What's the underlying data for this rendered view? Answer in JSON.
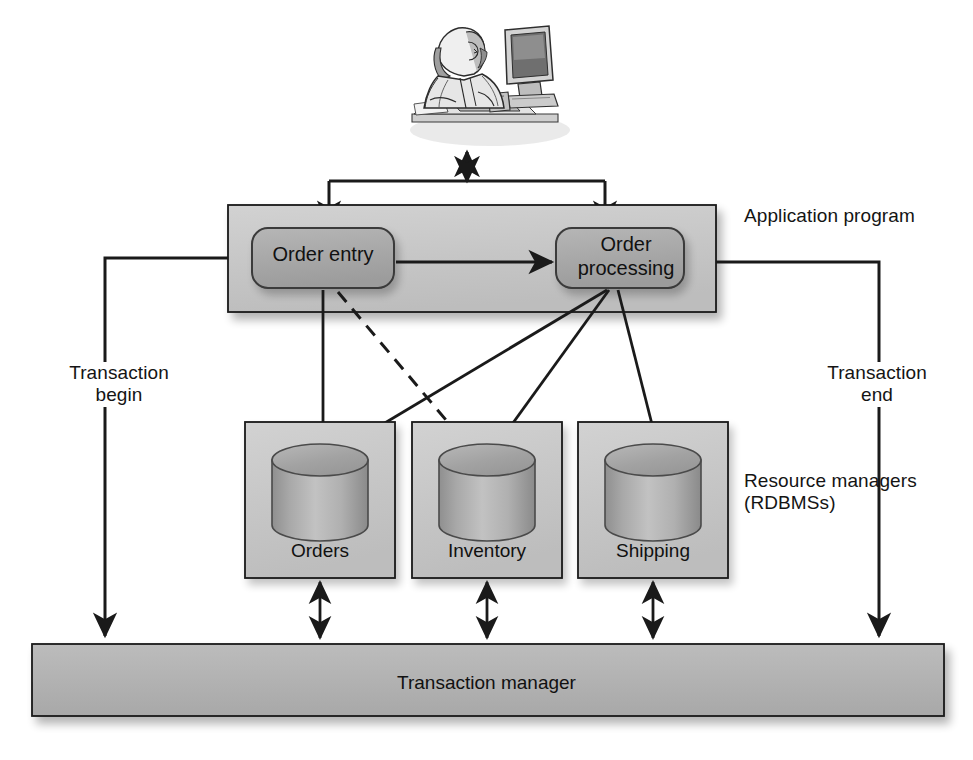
{
  "diagram": {
    "actor": {
      "name": "user-at-computer",
      "alt": "Person seated at a desktop computer"
    },
    "application_program": {
      "label": "Application program",
      "fill": "#c9c9c9",
      "stroke": "#1a1a1a",
      "components": [
        {
          "id": "order-entry",
          "label": "Order entry",
          "fill": "#a9a9a9"
        },
        {
          "id": "order-processing",
          "label": "Order processing",
          "fill": "#a9a9a9"
        }
      ]
    },
    "resource_managers": {
      "label": "Resource managers\n(RDBMSs)",
      "fill": "#c9c9c9",
      "stroke": "#1a1a1a",
      "databases": [
        {
          "id": "orders",
          "label": "Orders"
        },
        {
          "id": "inventory",
          "label": "Inventory"
        },
        {
          "id": "shipping",
          "label": "Shipping"
        }
      ]
    },
    "transaction_manager": {
      "label": "Transaction manager",
      "fill": "#b0b0b0",
      "stroke": "#1a1a1a"
    },
    "edge_labels": {
      "transaction_begin": "Transaction\nbegin",
      "transaction_end": "Transaction\nend"
    },
    "connections": [
      {
        "from": "user-at-computer",
        "to": "application-bus",
        "style": "solid",
        "arrow": "both"
      },
      {
        "from": "application-bus",
        "to": "order-entry",
        "style": "solid",
        "arrow": "end"
      },
      {
        "from": "order-processing",
        "to": "application-bus",
        "style": "solid",
        "arrow": "end"
      },
      {
        "from": "order-entry",
        "to": "order-processing",
        "style": "solid",
        "arrow": "end"
      },
      {
        "from": "order-entry",
        "to": "orders",
        "style": "solid",
        "arrow": "end"
      },
      {
        "from": "order-entry",
        "to": "inventory",
        "style": "dashed",
        "arrow": "end"
      },
      {
        "from": "order-processing",
        "to": "orders",
        "style": "solid",
        "arrow": "end"
      },
      {
        "from": "order-processing",
        "to": "inventory",
        "style": "solid",
        "arrow": "end"
      },
      {
        "from": "order-processing",
        "to": "shipping",
        "style": "solid",
        "arrow": "end"
      },
      {
        "from": "application-program",
        "to": "transaction-manager",
        "style": "solid",
        "arrow": "end",
        "label": "Transaction begin",
        "side": "left"
      },
      {
        "from": "application-program",
        "to": "transaction-manager",
        "style": "solid",
        "arrow": "end",
        "label": "Transaction end",
        "side": "right"
      },
      {
        "from": "orders",
        "to": "transaction-manager",
        "style": "solid",
        "arrow": "both"
      },
      {
        "from": "inventory",
        "to": "transaction-manager",
        "style": "solid",
        "arrow": "both"
      },
      {
        "from": "shipping",
        "to": "transaction-manager",
        "style": "solid",
        "arrow": "both"
      }
    ],
    "colors": {
      "line": "#1a1a1a",
      "panel_fill": "#c9c9c9",
      "node_fill": "#a9a9a9",
      "bar_fill": "#b0b0b0",
      "cylinder_fill": "#b4b4b4",
      "background": "#ffffff"
    }
  }
}
